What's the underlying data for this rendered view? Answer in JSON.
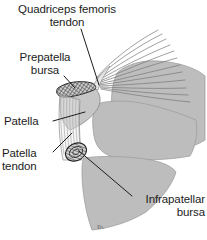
{
  "figure": {
    "background_color": "#ffffff",
    "bone_fill_color": "#bdbdbd",
    "bone_stroke_color": "#9a9a9a",
    "line_color": "#1c1c1c",
    "text_color": "#1c1c1c",
    "tendon_color": "#6e6e6e",
    "artifact_mark": "Ib."
  },
  "labels": {
    "quadriceps_tendon": "Quadriceps femoris\ntendon",
    "prepatella_bursa": "Prepatella\nbursa",
    "patella": "Patella",
    "patella_tendon": "Patella\ntendon",
    "infrapatellar_bursa": "Infrapatellar\nbursa"
  },
  "structures": [
    {
      "name": "quadriceps-femoris-tendon",
      "kind": "tendon"
    },
    {
      "name": "prepatella-bursa",
      "kind": "bursa"
    },
    {
      "name": "patella",
      "kind": "bone"
    },
    {
      "name": "patella-tendon",
      "kind": "tendon"
    },
    {
      "name": "infrapatellar-bursa",
      "kind": "bursa"
    },
    {
      "name": "femur-condyle",
      "kind": "bone"
    },
    {
      "name": "tibia",
      "kind": "bone"
    }
  ]
}
